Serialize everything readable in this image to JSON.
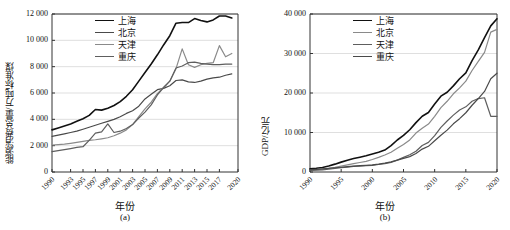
{
  "figure": {
    "panels": [
      {
        "id": "a",
        "sublabel": "(a)",
        "xlabel": "年份",
        "ylabel": "能源消费总量/万吨标准煤"
      },
      {
        "id": "b",
        "sublabel": "(b)",
        "xlabel": "年份",
        "ylabel": "GDP/亿元"
      }
    ]
  },
  "legend": {
    "entries": [
      {
        "label": "上海",
        "color": "#111111",
        "width": 1.6
      },
      {
        "label": "北京",
        "color": "#4a4a4a",
        "width": 1.2
      },
      {
        "label": "天津",
        "color": "#8a8a8a",
        "width": 1.2
      },
      {
        "label": "重庆",
        "color": "#5e5e5e",
        "width": 1.2
      }
    ]
  },
  "chart_data": [
    {
      "type": "line",
      "panel": "a",
      "title": "",
      "xlabel": "年份",
      "ylabel": "能源消费总量/万吨标准煤",
      "xlim": [
        1990,
        2020
      ],
      "ylim": [
        0,
        12000
      ],
      "xticks": [
        1990,
        1993,
        1995,
        1997,
        1999,
        2001,
        2003,
        2005,
        2007,
        2009,
        2011,
        2013,
        2015,
        2017,
        2020
      ],
      "xticklabels": [
        "1990",
        "1993",
        "1995",
        "1997",
        "1999",
        "2001",
        "2003",
        "2005",
        "2007",
        "2009",
        "2011",
        "2013",
        "2015",
        "2017",
        "2020"
      ],
      "yticks": [
        0,
        2000,
        4000,
        6000,
        8000,
        10000,
        12000
      ],
      "yticklabels": [
        "0",
        "2 000",
        "4 000",
        "6 000",
        "8 000",
        "10 000",
        "12 000"
      ],
      "grid": "horizontal",
      "legend_position": "top-center",
      "x": [
        1990,
        1991,
        1992,
        1993,
        1994,
        1995,
        1996,
        1997,
        1998,
        1999,
        2000,
        2001,
        2002,
        2003,
        2004,
        2005,
        2006,
        2007,
        2008,
        2009,
        2010,
        2011,
        2012,
        2013,
        2014,
        2015,
        2016,
        2017,
        2018,
        2019
      ],
      "series": [
        {
          "name": "上海",
          "color": "#111111",
          "values": [
            3200,
            3350,
            3500,
            3650,
            3850,
            4050,
            4300,
            4750,
            4700,
            4850,
            5050,
            5350,
            5750,
            6250,
            6900,
            7550,
            8200,
            8900,
            9650,
            10350,
            11300,
            11350,
            11350,
            11650,
            11500,
            11400,
            11550,
            11850,
            11850,
            11700
          ],
          "width": 1.6
        },
        {
          "name": "北京",
          "color": "#4a4a4a",
          "values": [
            2700,
            2800,
            2900,
            3000,
            3100,
            3250,
            3400,
            3550,
            3700,
            3850,
            4000,
            4200,
            4450,
            4650,
            5000,
            5550,
            5900,
            6250,
            6350,
            6550,
            6950,
            7000,
            6850,
            6800,
            6900,
            7050,
            7150,
            7200,
            7350,
            7450
          ],
          "width": 1.2
        },
        {
          "name": "天津",
          "color": "#8a8a8a",
          "values": [
            2050,
            2080,
            2120,
            2180,
            2250,
            2320,
            2400,
            2450,
            2520,
            2600,
            2750,
            2950,
            3200,
            3600,
            4200,
            4800,
            5300,
            5950,
            6450,
            6900,
            7850,
            9350,
            8150,
            7950,
            8150,
            8250,
            8300,
            9600,
            8750,
            9000
          ],
          "width": 1.2
        },
        {
          "name": "重庆",
          "color": "#5e5e5e",
          "values": [
            1550,
            1620,
            1700,
            1780,
            1870,
            1920,
            2400,
            2950,
            3050,
            3650,
            3000,
            3100,
            3300,
            3600,
            4100,
            4550,
            5100,
            5850,
            6400,
            6900,
            7900,
            8050,
            8300,
            8350,
            8250,
            8200,
            8150,
            8150,
            8200,
            8200
          ],
          "width": 1.2
        }
      ]
    },
    {
      "type": "line",
      "panel": "b",
      "title": "",
      "xlabel": "年份",
      "ylabel": "GDP/亿元",
      "xlim": [
        1990,
        2020
      ],
      "ylim": [
        0,
        40000
      ],
      "xticks": [
        1990,
        1995,
        2000,
        2005,
        2010,
        2015,
        2020
      ],
      "xticklabels": [
        "1990",
        "1995",
        "2000",
        "2005",
        "2010",
        "2015",
        "2020"
      ],
      "yticks": [
        0,
        10000,
        20000,
        30000,
        40000
      ],
      "yticklabels": [
        "0",
        "10 000",
        "20 000",
        "30 000",
        "40 000"
      ],
      "grid": "horizontal",
      "legend_position": "top-center",
      "x": [
        1990,
        1991,
        1992,
        1993,
        1994,
        1995,
        1996,
        1997,
        1998,
        1999,
        2000,
        2001,
        2002,
        2003,
        2004,
        2005,
        2006,
        2007,
        2008,
        2009,
        2010,
        2011,
        2012,
        2013,
        2014,
        2015,
        2016,
        2017,
        2018,
        2019,
        2020
      ],
      "series": [
        {
          "name": "上海",
          "color": "#111111",
          "values": [
            800,
            950,
            1150,
            1520,
            1990,
            2500,
            2950,
            3400,
            3750,
            4100,
            4550,
            5000,
            5550,
            6700,
            8100,
            9250,
            10700,
            12500,
            14100,
            15050,
            17200,
            19200,
            20200,
            21800,
            23600,
            25100,
            28200,
            30900,
            34000,
            37000,
            38800
          ],
          "width": 1.6
        },
        {
          "name": "北京",
          "color": "#8a8a8a",
          "values": [
            500,
            600,
            750,
            950,
            1200,
            1500,
            1800,
            2100,
            2400,
            2700,
            3160,
            3700,
            4300,
            5000,
            6000,
            6970,
            8120,
            9850,
            11100,
            12150,
            14100,
            16300,
            17900,
            19800,
            21300,
            23000,
            25700,
            28000,
            30300,
            35400,
            36100
          ],
          "width": 1.2
        },
        {
          "name": "天津",
          "color": "#5e5e5e",
          "values": [
            400,
            450,
            550,
            700,
            920,
            1100,
            1250,
            1400,
            1500,
            1600,
            1700,
            1900,
            2100,
            2450,
            3000,
            3700,
            4360,
            5250,
            6720,
            7500,
            9200,
            11300,
            12900,
            14400,
            15700,
            16500,
            17900,
            18600,
            18800,
            14100,
            14100
          ],
          "width": 1.2
        },
        {
          "name": "重庆",
          "color": "#4a4a4a",
          "values": [
            600,
            680,
            790,
            920,
            1080,
            1200,
            1350,
            1500,
            1600,
            1700,
            1790,
            1980,
            2230,
            2550,
            3000,
            3450,
            3900,
            4680,
            5800,
            6500,
            7900,
            9300,
            10600,
            12200,
            13500,
            15000,
            16900,
            18600,
            20400,
            23600,
            25000
          ],
          "width": 1.2
        }
      ]
    }
  ]
}
